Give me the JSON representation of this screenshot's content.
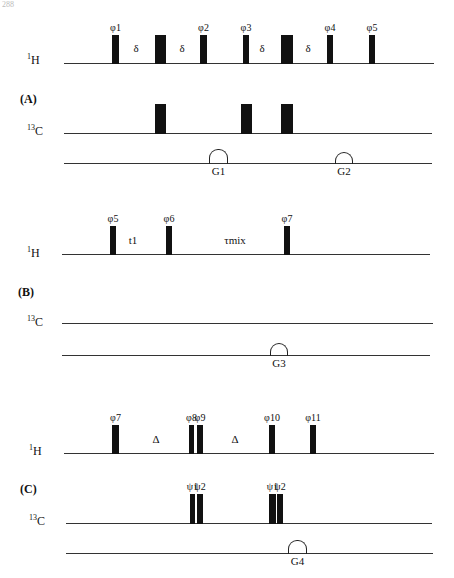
{
  "page": {
    "number": "288"
  },
  "sections": [
    {
      "id": "A",
      "label": "(A)",
      "label_pos": [
        20,
        92
      ],
      "channels": [
        {
          "name_base": "1",
          "name_sub": "H",
          "label_pos": [
            27,
            51
          ],
          "line": {
            "y": 63,
            "x1": 64,
            "x2": 434
          },
          "pulses": [
            {
              "x": 112,
              "w": 7,
              "top": 35,
              "phase": "φ1"
            },
            {
              "x": 155,
              "w": 11,
              "top": 35,
              "phase": ""
            },
            {
              "x": 200,
              "w": 7,
              "top": 35,
              "phase": "φ2"
            },
            {
              "x": 243,
              "w": 6,
              "top": 35,
              "phase": "φ3"
            },
            {
              "x": 281,
              "w": 12,
              "top": 35,
              "phase": ""
            },
            {
              "x": 327,
              "w": 6,
              "top": 35,
              "phase": "φ4"
            },
            {
              "x": 369,
              "w": 6,
              "top": 35,
              "phase": "φ5"
            }
          ],
          "delays": [
            {
              "x": 136,
              "y": 42,
              "text": "δ"
            },
            {
              "x": 182,
              "y": 42,
              "text": "δ"
            },
            {
              "x": 262,
              "y": 42,
              "text": "δ"
            },
            {
              "x": 308,
              "y": 42,
              "text": "δ"
            }
          ]
        },
        {
          "name_base": "13",
          "name_sub": "C",
          "label_pos": [
            27,
            122
          ],
          "line": {
            "y": 133,
            "x1": 64,
            "x2": 432
          },
          "pulses": [
            {
              "x": 155,
              "w": 11,
              "top": 104,
              "phase": ""
            },
            {
              "x": 241,
              "w": 11,
              "top": 104,
              "phase": ""
            },
            {
              "x": 281,
              "w": 12,
              "top": 104,
              "phase": ""
            }
          ],
          "delays": []
        }
      ],
      "gradient_line": {
        "y": 163,
        "x1": 64,
        "x2": 432
      },
      "gradients": [
        {
          "x": 209,
          "w": 17,
          "h": 14,
          "label": "G1"
        },
        {
          "x": 335,
          "w": 16,
          "h": 11,
          "label": "G2"
        }
      ]
    },
    {
      "id": "B",
      "label": "(B)",
      "label_pos": [
        18,
        285
      ],
      "channels": [
        {
          "name_base": "1",
          "name_sub": "H",
          "label_pos": [
            27,
            244
          ],
          "line": {
            "y": 254,
            "x1": 62,
            "x2": 430
          },
          "pulses": [
            {
              "x": 110,
              "w": 6,
              "top": 226,
              "phase": "φ5"
            },
            {
              "x": 166,
              "w": 6,
              "top": 226,
              "phase": "φ6"
            },
            {
              "x": 284,
              "w": 6,
              "top": 226,
              "phase": "φ7"
            }
          ],
          "delays": [
            {
              "x": 133,
              "y": 234,
              "text": "t1"
            },
            {
              "x": 235,
              "y": 234,
              "text": "τmix"
            }
          ]
        },
        {
          "name_base": "13",
          "name_sub": "C",
          "label_pos": [
            27,
            313
          ],
          "line": {
            "y": 323,
            "x1": 62,
            "x2": 433
          },
          "pulses": [],
          "delays": []
        }
      ],
      "gradient_line": {
        "y": 355,
        "x1": 62,
        "x2": 430
      },
      "gradients": [
        {
          "x": 270,
          "w": 16,
          "h": 12,
          "label": "G3"
        }
      ]
    },
    {
      "id": "C",
      "label": "(C)",
      "label_pos": [
        20,
        482
      ],
      "channels": [
        {
          "name_base": "1",
          "name_sub": "H",
          "label_pos": [
            29,
            442
          ],
          "line": {
            "y": 453,
            "x1": 64,
            "x2": 434
          },
          "pulses": [
            {
              "x": 112,
              "w": 7,
              "top": 425,
              "phase": "φ7"
            },
            {
              "x": 189,
              "w": 5,
              "top": 425,
              "phase": "φ8"
            },
            {
              "x": 197,
              "w": 6,
              "top": 425,
              "phase": "φ9"
            },
            {
              "x": 269,
              "w": 6,
              "top": 425,
              "phase": "φ10"
            },
            {
              "x": 310,
              "w": 6,
              "top": 425,
              "phase": "φ11"
            }
          ],
          "delays": [
            {
              "x": 156,
              "y": 433,
              "text": "Δ"
            },
            {
              "x": 235,
              "y": 433,
              "text": "Δ"
            }
          ]
        },
        {
          "name_base": "13",
          "name_sub": "C",
          "label_pos": [
            29,
            512
          ],
          "line": {
            "y": 523,
            "x1": 66,
            "x2": 432
          },
          "pulses": [
            {
              "x": 190,
              "w": 5,
              "top": 494,
              "phase": "ψ1"
            },
            {
              "x": 197,
              "w": 6,
              "top": 494,
              "phase": "ψ2"
            },
            {
              "x": 269,
              "w": 7,
              "top": 494,
              "phase": "ψ1"
            },
            {
              "x": 277,
              "w": 6,
              "top": 494,
              "phase": "ψ2"
            }
          ],
          "delays": []
        }
      ],
      "gradient_line": {
        "y": 553,
        "x1": 66,
        "x2": 433
      },
      "gradients": [
        {
          "x": 288,
          "w": 17,
          "h": 13,
          "label": "G4"
        }
      ]
    }
  ]
}
